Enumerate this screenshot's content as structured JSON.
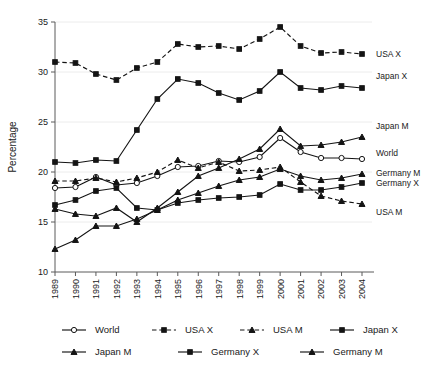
{
  "chart_data": {
    "type": "line",
    "title": "",
    "xlabel": "",
    "ylabel": "Percentage",
    "ylim": [
      10,
      35
    ],
    "yticks": [
      10,
      15,
      20,
      25,
      30,
      35
    ],
    "grid": true,
    "legend_position": "bottom",
    "x": [
      1989,
      1990,
      1991,
      1992,
      1993,
      1994,
      1995,
      1996,
      1997,
      1998,
      1999,
      2000,
      2001,
      2002,
      2003,
      2004
    ],
    "categories": [
      "1989",
      "1990",
      "1991",
      "1992",
      "1993",
      "1994",
      "1995",
      "1996",
      "1997",
      "1998",
      "1999",
      "2000",
      "2001",
      "2002",
      "2003",
      "2004"
    ],
    "series": [
      {
        "name": "World",
        "marker": "circle-open",
        "dash": "solid",
        "edge_label": "World",
        "values": [
          18.4,
          18.5,
          19.5,
          18.7,
          18.9,
          19.6,
          20.5,
          20.6,
          21.1,
          21.0,
          21.5,
          23.4,
          22.0,
          21.4,
          21.4,
          21.3
        ]
      },
      {
        "name": "USA X",
        "marker": "square",
        "dash": "dashed",
        "edge_label": "USA X",
        "values": [
          31.0,
          30.9,
          29.8,
          29.2,
          30.4,
          31.0,
          32.8,
          32.5,
          32.6,
          32.3,
          33.3,
          34.5,
          32.6,
          31.9,
          32.0,
          31.8
        ]
      },
      {
        "name": "USA M",
        "marker": "triangle",
        "dash": "dashed",
        "edge_label": "USA M",
        "values": [
          19.1,
          19.1,
          19.4,
          19.0,
          19.4,
          20.0,
          21.2,
          20.4,
          21.0,
          20.1,
          20.2,
          20.5,
          19.0,
          17.6,
          17.1,
          16.8
        ]
      },
      {
        "name": "Japan X",
        "marker": "square",
        "dash": "solid",
        "edge_label": "Japan X",
        "values": [
          21.0,
          20.9,
          21.2,
          21.1,
          24.2,
          27.3,
          29.3,
          28.9,
          27.9,
          27.2,
          28.1,
          30.0,
          28.4,
          28.2,
          28.6,
          28.4
        ]
      },
      {
        "name": "Japan M",
        "marker": "triangle",
        "dash": "solid",
        "edge_label": "Japan M",
        "values": [
          16.3,
          15.8,
          15.6,
          16.4,
          15.0,
          16.4,
          18.0,
          19.6,
          20.4,
          21.3,
          22.3,
          24.3,
          22.6,
          22.7,
          23.0,
          23.5
        ]
      },
      {
        "name": "Germany X",
        "marker": "square",
        "dash": "solid",
        "edge_label": "Germany X",
        "values": [
          16.7,
          17.2,
          18.1,
          18.4,
          16.4,
          16.2,
          16.9,
          17.2,
          17.4,
          17.5,
          17.7,
          18.8,
          18.2,
          18.2,
          18.5,
          18.9
        ]
      },
      {
        "name": "Germany M",
        "marker": "triangle",
        "dash": "solid",
        "edge_label": "Germany M",
        "values": [
          12.3,
          13.2,
          14.6,
          14.6,
          15.3,
          16.2,
          17.2,
          17.9,
          18.6,
          19.2,
          19.5,
          20.3,
          19.6,
          19.2,
          19.4,
          19.8
        ]
      }
    ],
    "legend": [
      {
        "label": "World",
        "marker": "circle-open",
        "dash": "solid"
      },
      {
        "label": "USA X",
        "marker": "square",
        "dash": "dashed"
      },
      {
        "label": "USA M",
        "marker": "triangle",
        "dash": "dashed"
      },
      {
        "label": "Japan X",
        "marker": "square",
        "dash": "solid"
      },
      {
        "label": "Japan M",
        "marker": "triangle",
        "dash": "solid"
      },
      {
        "label": "Germany X",
        "marker": "square",
        "dash": "solid"
      },
      {
        "label": "Germany M",
        "marker": "triangle",
        "dash": "solid"
      }
    ],
    "edge_labels": [
      {
        "text": "USA X",
        "value": 31.8,
        "series": "USA X"
      },
      {
        "text": "Japan X",
        "value": 29.6,
        "series": "Japan X"
      },
      {
        "text": "Japan M",
        "value": 24.6,
        "series": "Japan M"
      },
      {
        "text": "World",
        "value": 21.9,
        "series": "World"
      },
      {
        "text": "Germany M",
        "value": 19.9,
        "series": "Germany M"
      },
      {
        "text": "Germany X",
        "value": 18.9,
        "series": "Germany X"
      },
      {
        "text": "USA M",
        "value": 16.0,
        "series": "USA M"
      }
    ]
  }
}
